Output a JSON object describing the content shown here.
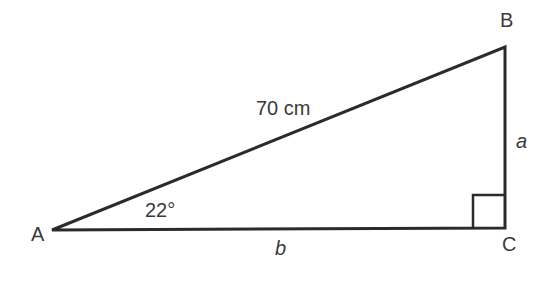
{
  "diagram": {
    "type": "right-triangle",
    "vertices": {
      "A": {
        "label": "A",
        "x": 52,
        "y": 230
      },
      "B": {
        "label": "B",
        "x": 505,
        "y": 48
      },
      "C": {
        "label": "C",
        "x": 505,
        "y": 228
      }
    },
    "right_angle_at": "C",
    "angle_label": "22°",
    "hypotenuse_label": "70 cm",
    "side_a_label": "a",
    "side_b_label": "b",
    "colors": {
      "line": "#2b2b2b",
      "text": "#3a3a3a",
      "background": "#ffffff"
    }
  }
}
